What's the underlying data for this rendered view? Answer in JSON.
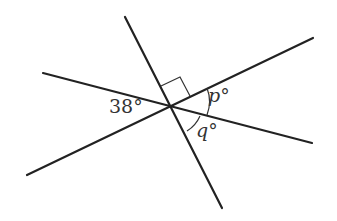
{
  "diagram": {
    "labels": {
      "given_angle": "38°",
      "angle_p": "p°",
      "angle_q": "q°"
    },
    "lines": [
      {
        "name": "line-1",
        "x1": 27,
        "y1": 175,
        "x2": 313,
        "y2": 38
      },
      {
        "name": "line-2",
        "x1": 43,
        "y1": 73,
        "x2": 312,
        "y2": 143
      },
      {
        "name": "line-3",
        "x1": 125,
        "y1": 17,
        "x2": 222,
        "y2": 208
      }
    ],
    "right_angle_marker": true,
    "color": "#222222"
  }
}
